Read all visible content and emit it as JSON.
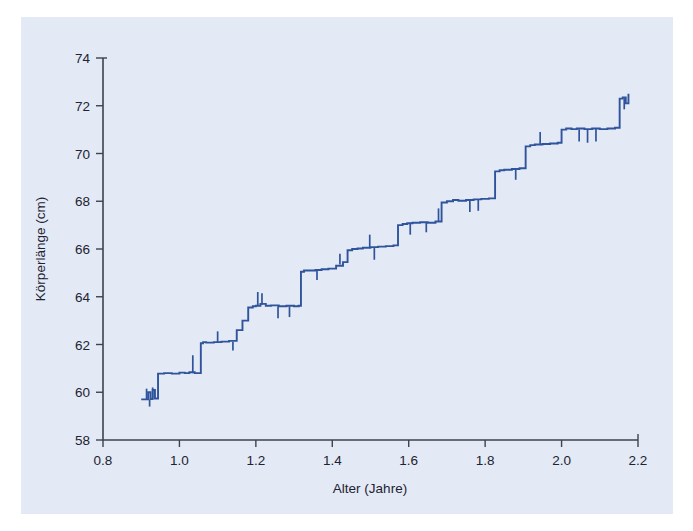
{
  "figure": {
    "background_color": "#ffffff",
    "panel_color": "#e3e9f5",
    "line_color": "#2f549c",
    "axis_color": "#3c4450"
  },
  "chart_data": {
    "type": "line",
    "title": "",
    "subtitle": "",
    "xlabel": "Alter (Jahre)",
    "ylabel": "Körperlänge (cm)",
    "xlim": [
      0.8,
      2.2
    ],
    "ylim": [
      58,
      74
    ],
    "xticks": [
      0.8,
      1.0,
      1.2,
      1.4,
      1.6,
      1.8,
      2.0,
      2.2
    ],
    "xtick_labels": [
      "0.8",
      "1.0",
      "1.2",
      "1.4",
      "1.6",
      "1.8",
      "2.0",
      "2.2"
    ],
    "yticks": [
      58,
      60,
      62,
      64,
      66,
      68,
      70,
      72,
      74
    ],
    "ytick_labels": [
      "58",
      "60",
      "62",
      "64",
      "66",
      "68",
      "70",
      "72",
      "74"
    ],
    "grid": false,
    "legend": null,
    "annotations": [],
    "series": [
      {
        "name": "Körperlänge",
        "color": "#2f549c",
        "x": [
          0.9,
          0.912,
          0.918,
          0.924,
          0.93,
          0.936,
          0.944,
          0.96,
          0.98,
          1.0,
          1.014,
          1.026,
          1.04,
          1.05,
          1.056,
          1.062,
          1.07,
          1.09,
          1.11,
          1.13,
          1.15,
          1.165,
          1.18,
          1.192,
          1.2,
          1.212,
          1.226,
          1.24,
          1.26,
          1.28,
          1.3,
          1.312,
          1.318,
          1.326,
          1.34,
          1.356,
          1.372,
          1.39,
          1.41,
          1.428,
          1.44,
          1.452,
          1.466,
          1.48,
          1.5,
          1.52,
          1.54,
          1.56,
          1.572,
          1.584,
          1.596,
          1.61,
          1.63,
          1.65,
          1.67,
          1.686,
          1.7,
          1.716,
          1.73,
          1.75,
          1.77,
          1.79,
          1.81,
          1.826,
          1.838,
          1.85,
          1.87,
          1.89,
          1.906,
          1.918,
          1.93,
          1.95,
          1.97,
          1.99,
          2.0,
          2.012,
          2.026,
          2.04,
          2.06,
          2.08,
          2.1,
          2.12,
          2.14,
          2.152,
          2.16,
          2.168,
          2.175
        ],
        "y": [
          59.7,
          59.7,
          60.0,
          59.72,
          60.1,
          59.74,
          60.78,
          60.8,
          60.78,
          60.82,
          60.8,
          60.84,
          60.8,
          60.8,
          62.05,
          62.1,
          62.08,
          62.1,
          62.12,
          62.15,
          62.6,
          63.0,
          63.55,
          63.6,
          63.62,
          63.7,
          63.62,
          63.64,
          63.6,
          63.62,
          63.6,
          63.62,
          65.05,
          65.1,
          65.1,
          65.12,
          65.15,
          65.18,
          65.3,
          65.45,
          65.95,
          66.0,
          66.02,
          66.05,
          66.08,
          66.1,
          66.12,
          66.15,
          67.0,
          67.05,
          67.08,
          67.1,
          67.12,
          67.1,
          67.15,
          67.95,
          68.0,
          68.05,
          68.02,
          68.05,
          68.08,
          68.1,
          68.12,
          69.25,
          69.3,
          69.32,
          69.35,
          69.38,
          70.3,
          70.35,
          70.38,
          70.4,
          70.42,
          70.45,
          71.0,
          71.05,
          71.02,
          71.05,
          71.02,
          71.05,
          71.02,
          71.05,
          71.08,
          72.3,
          72.35,
          72.1,
          72.5
        ],
        "noise_spikes": [
          {
            "x": 0.914,
            "y_from": 59.7,
            "y_to": 60.15
          },
          {
            "x": 0.922,
            "y_from": 59.7,
            "y_to": 59.4
          },
          {
            "x": 0.93,
            "y_from": 59.72,
            "y_to": 60.2
          },
          {
            "x": 1.035,
            "y_from": 60.8,
            "y_to": 61.55
          },
          {
            "x": 1.1,
            "y_from": 62.1,
            "y_to": 62.55
          },
          {
            "x": 1.14,
            "y_from": 62.12,
            "y_to": 61.75
          },
          {
            "x": 1.205,
            "y_from": 63.62,
            "y_to": 64.2
          },
          {
            "x": 1.216,
            "y_from": 63.66,
            "y_to": 64.15
          },
          {
            "x": 1.258,
            "y_from": 63.6,
            "y_to": 63.1
          },
          {
            "x": 1.288,
            "y_from": 63.6,
            "y_to": 63.15
          },
          {
            "x": 1.36,
            "y_from": 65.12,
            "y_to": 64.7
          },
          {
            "x": 1.42,
            "y_from": 65.35,
            "y_to": 65.8
          },
          {
            "x": 1.498,
            "y_from": 66.08,
            "y_to": 66.6
          },
          {
            "x": 1.51,
            "y_from": 66.08,
            "y_to": 65.55
          },
          {
            "x": 1.604,
            "y_from": 67.1,
            "y_to": 66.6
          },
          {
            "x": 1.646,
            "y_from": 67.12,
            "y_to": 66.7
          },
          {
            "x": 1.678,
            "y_from": 67.15,
            "y_to": 67.7
          },
          {
            "x": 1.76,
            "y_from": 68.06,
            "y_to": 67.55
          },
          {
            "x": 1.782,
            "y_from": 68.08,
            "y_to": 67.6
          },
          {
            "x": 1.88,
            "y_from": 69.35,
            "y_to": 68.9
          },
          {
            "x": 1.944,
            "y_from": 70.4,
            "y_to": 70.9
          },
          {
            "x": 2.046,
            "y_from": 71.02,
            "y_to": 70.5
          },
          {
            "x": 2.068,
            "y_from": 71.02,
            "y_to": 70.45
          },
          {
            "x": 2.09,
            "y_from": 71.04,
            "y_to": 70.5
          },
          {
            "x": 2.164,
            "y_from": 72.32,
            "y_to": 71.85
          }
        ]
      }
    ]
  }
}
